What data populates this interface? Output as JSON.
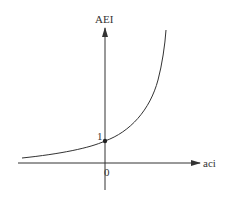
{
  "diagram": {
    "type": "exponential-curve-graph",
    "y_axis_label": "AEI",
    "x_axis_label": "aci",
    "origin_label": "0",
    "intercept_label": "1",
    "colors": {
      "line": "#333333",
      "background": "#ffffff"
    }
  }
}
